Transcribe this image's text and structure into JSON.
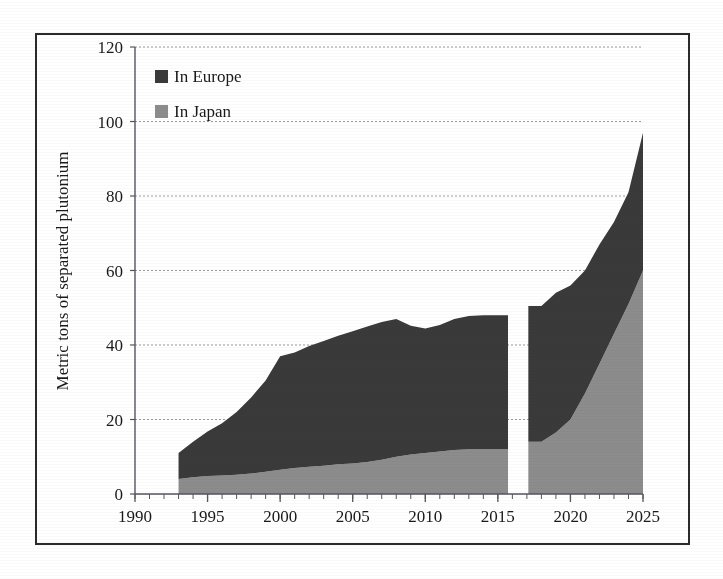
{
  "figure": {
    "background_color": "#ffffff",
    "frame_color": "#2b2b2b"
  },
  "legend": {
    "position": "top-left-inside",
    "entries": [
      {
        "label": "In Europe",
        "color": "#3a3a3a",
        "swatch_name": "legend-swatch-europe"
      },
      {
        "label": "In Japan",
        "color": "#8c8c8c",
        "swatch_name": "legend-swatch-japan"
      }
    ]
  },
  "axes": {
    "y_title": "Metric tons of separated plutonium",
    "y_ticks": [
      "0",
      "20",
      "40",
      "60",
      "80",
      "100",
      "120"
    ],
    "x_ticks": [
      "1990",
      "1995",
      "2000",
      "2005",
      "2010",
      "2015",
      "2020",
      "2025"
    ],
    "x_minor_tick_interval_years": 1,
    "grid": "horizontal-dotted"
  },
  "chart_data": {
    "type": "area",
    "stacked": true,
    "title": "",
    "xlabel": "",
    "ylabel": "Metric tons of separated plutonium",
    "xlim": [
      1990,
      2025
    ],
    "ylim": [
      0,
      120
    ],
    "yticks": [
      0,
      20,
      40,
      60,
      80,
      100,
      120
    ],
    "xticks": [
      1990,
      1995,
      2000,
      2005,
      2010,
      2015,
      2020,
      2025
    ],
    "grid": true,
    "legend_position": "upper left",
    "data_gap": {
      "from": 2015.7,
      "to": 2017.1,
      "note": "blank vertical band separating historical record from projection"
    },
    "x": [
      1993,
      1994,
      1995,
      1996,
      1997,
      1998,
      1999,
      2000,
      2001,
      2002,
      2003,
      2004,
      2005,
      2006,
      2007,
      2008,
      2009,
      2010,
      2011,
      2012,
      2013,
      2014,
      2015,
      2017,
      2018,
      2019,
      2020,
      2021,
      2022,
      2023,
      2024,
      2025
    ],
    "series": [
      {
        "name": "In Japan",
        "color": "#8c8c8c",
        "values": [
          4,
          4.5,
          4.8,
          5,
          5.2,
          5.5,
          6,
          6.5,
          7,
          7.3,
          7.6,
          8,
          8.2,
          8.6,
          9.2,
          10,
          10.6,
          11,
          11.4,
          11.8,
          12,
          12,
          12,
          12,
          14,
          16.5,
          20,
          27,
          35,
          43,
          51,
          60
        ]
      },
      {
        "name": "In Europe",
        "color": "#3a3a3a",
        "values": [
          7,
          9.5,
          12,
          14,
          16.8,
          20.4,
          24.5,
          30.5,
          31,
          32.4,
          33.5,
          34.5,
          35.5,
          36.4,
          37,
          37,
          34.6,
          33.4,
          34,
          35.2,
          35.8,
          36,
          36,
          36,
          36.5,
          37.5,
          36,
          33,
          32,
          30,
          30,
          37
        ]
      }
    ],
    "totals": [
      11,
      14,
      16.8,
      19,
      22,
      25.9,
      30.5,
      37,
      38,
      39.7,
      41.1,
      42.5,
      43.7,
      45,
      46.2,
      47,
      45.2,
      44.4,
      45.4,
      47,
      47.8,
      48,
      48,
      48,
      50.5,
      54,
      56,
      60,
      67,
      73,
      81,
      97
    ]
  }
}
